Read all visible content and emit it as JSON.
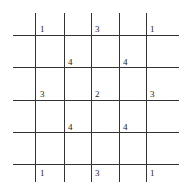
{
  "grid": {
    "vertical_lines_x": [
      35,
      64,
      91,
      119,
      146
    ],
    "vertical_span": [
      13,
      182
    ],
    "horizontal_lines_y": [
      35,
      67,
      100,
      132,
      164
    ],
    "horizontal_span": [
      13,
      179
    ],
    "line_color": "#333333"
  },
  "labels": [
    {
      "value": "1",
      "x": 40,
      "y": 25
    },
    {
      "value": "3",
      "x": 95,
      "y": 25
    },
    {
      "value": "1",
      "x": 150,
      "y": 25
    },
    {
      "value": "4",
      "x": 68,
      "y": 58
    },
    {
      "value": "4",
      "x": 123,
      "y": 58
    },
    {
      "value": "3",
      "x": 40,
      "y": 90
    },
    {
      "value": "2",
      "x": 95,
      "y": 90
    },
    {
      "value": "3",
      "x": 150,
      "y": 90
    },
    {
      "value": "4",
      "x": 68,
      "y": 123
    },
    {
      "value": "4",
      "x": 123,
      "y": 123
    },
    {
      "value": "1",
      "x": 40,
      "y": 169
    },
    {
      "value": "3",
      "x": 95,
      "y": 169
    },
    {
      "value": "1",
      "x": 150,
      "y": 169
    }
  ]
}
